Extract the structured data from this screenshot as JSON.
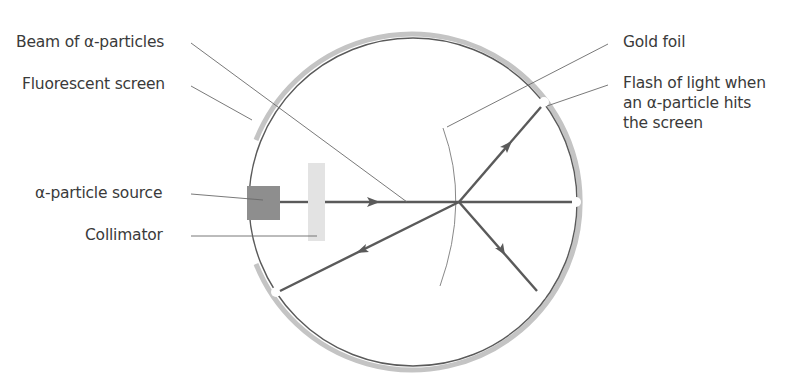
{
  "diagram": {
    "labels": {
      "beam": "Beam of α-particles",
      "screen": "Fluorescent screen",
      "source": "α-particle source",
      "collimator": "Collimator",
      "gold_foil": "Gold foil",
      "flash_line1": "Flash of light when",
      "flash_line2": "an α-particle hits",
      "flash_line3": "the screen"
    },
    "geometry": {
      "circle_center": [
        412,
        202
      ],
      "circle_radius": 166,
      "beam_y": 202,
      "foil_hit_point": [
        459,
        202
      ]
    },
    "colors": {
      "screen_band": "#bdbdbd",
      "chamber_line": "#555555",
      "ray": "#555555",
      "leader": "#666666",
      "source_block": "#8c8c8c",
      "collimator": "#e2e2e2",
      "text": "#3a3a3a"
    }
  }
}
